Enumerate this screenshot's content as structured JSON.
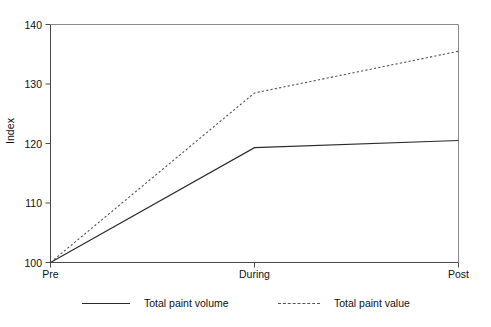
{
  "chart_data": {
    "type": "line",
    "title": "",
    "xlabel": "",
    "ylabel": "Index",
    "categories": [
      "Pre",
      "During",
      "Post"
    ],
    "ylim": [
      100,
      140
    ],
    "yticks": [
      100,
      110,
      120,
      130,
      140
    ],
    "ytick_labels": [
      "100",
      "110",
      "120",
      "130",
      "140"
    ],
    "grid": false,
    "legend_position": "bottom",
    "series": [
      {
        "name": "Total paint volume",
        "style": "solid",
        "color": "#2b2b2b",
        "values": [
          100,
          119.3,
          120.5
        ]
      },
      {
        "name": "Total paint value",
        "style": "dashed",
        "color": "#555555",
        "values": [
          100,
          128.5,
          135.5
        ]
      }
    ]
  },
  "axis": {
    "y_title": "Index"
  }
}
